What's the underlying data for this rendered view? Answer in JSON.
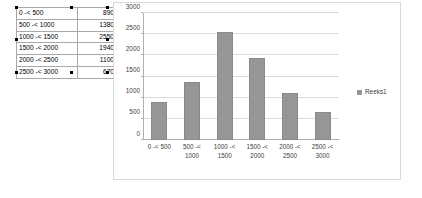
{
  "spreadsheet": {
    "name": "frequency-table",
    "columns": [
      "bin",
      "frequency"
    ],
    "rows": [
      {
        "bin": "0 -< 500",
        "frequency": "890"
      },
      {
        "bin": "500 -< 1000",
        "frequency": "1380"
      },
      {
        "bin": "1000 -< 1500",
        "frequency": "2550"
      },
      {
        "bin": "1500 -< 2000",
        "frequency": "1940"
      },
      {
        "bin": "2000 -< 2500",
        "frequency": "1100"
      },
      {
        "bin": "2500 -< 3000",
        "frequency": "670"
      }
    ]
  },
  "legend": {
    "position": "right",
    "entries": [
      "Reeks1"
    ]
  },
  "colors": {
    "bar_fill": "#969696",
    "bar_border": "#8a8a8a",
    "gridline": "#dcdcdc",
    "axis_line": "#b0b0b0",
    "chart_border": "#d9d9d9",
    "text": "#404040"
  },
  "chart_data": {
    "type": "bar",
    "title": "",
    "xlabel": "",
    "ylabel": "",
    "categories": [
      "0 -< 500",
      "500 -< 1000",
      "1000 -< 1500",
      "1500 -< 2000",
      "2000 -< 2500",
      "2500 -< 3000"
    ],
    "category_lines": [
      [
        "0 -< 500",
        ""
      ],
      [
        "500 -<",
        "1000"
      ],
      [
        "1000 -<",
        "1500"
      ],
      [
        "1500 -<",
        "2000"
      ],
      [
        "2000 -<",
        "2500"
      ],
      [
        "2500 -<",
        "3000"
      ]
    ],
    "series": [
      {
        "name": "Reeks1",
        "values": [
          890,
          1380,
          2550,
          1940,
          1100,
          670
        ]
      }
    ],
    "ylim": [
      0,
      3000
    ],
    "ytick_step": 500,
    "yticks": [
      0,
      500,
      1000,
      1500,
      2000,
      2500,
      3000
    ],
    "ytick_labels": [
      "0",
      "500",
      "1000",
      "1500",
      "2000",
      "2500",
      "3000"
    ],
    "grid": true,
    "legend_position": "right"
  }
}
